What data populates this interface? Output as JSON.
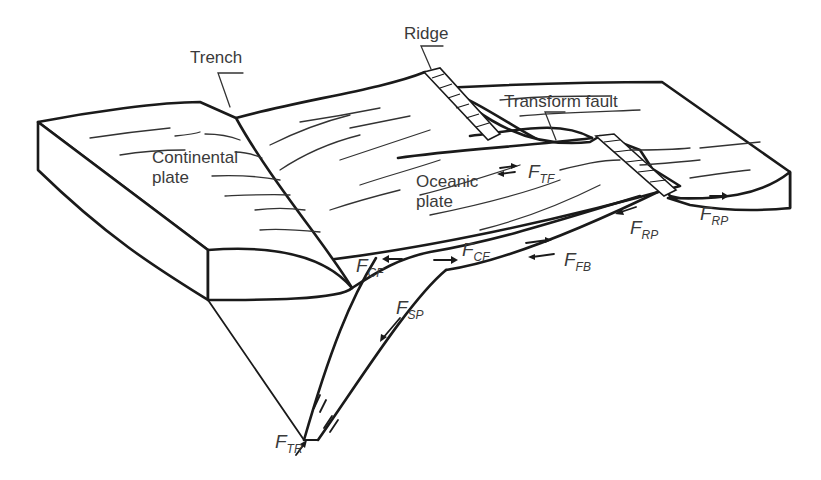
{
  "figure": {
    "labels": {
      "trench": "Trench",
      "ridge": "Ridge",
      "transform_fault": "Transform fault",
      "continental_plate_line1": "Continental",
      "continental_plate_line2": "plate",
      "oceanic_plate_line1": "Oceanic",
      "oceanic_plate_line2": "plate"
    },
    "forces": {
      "ftf": {
        "symbol": "F",
        "sub": "TF"
      },
      "frp_upper": {
        "symbol": "F",
        "sub": "RP"
      },
      "frp_right": {
        "symbol": "F",
        "sub": "RP"
      },
      "fcf_left": {
        "symbol": "F",
        "sub": "CF"
      },
      "fcf_right": {
        "symbol": "F",
        "sub": "CF"
      },
      "ffb": {
        "symbol": "F",
        "sub": "FB"
      },
      "fsp": {
        "symbol": "F",
        "sub": "SP"
      },
      "ftr": {
        "symbol": "F",
        "sub": "TR"
      }
    },
    "colors": {
      "line": "#1a1a1a",
      "text": "#3a3a3a",
      "background": "#ffffff"
    }
  }
}
